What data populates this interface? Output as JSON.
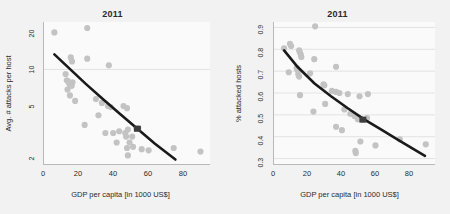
{
  "figure": {
    "background_color": "#f2f2f2",
    "panel_background_color": "#fafafa",
    "point_color": "#c3c3c3",
    "curve_color": "#1a1a1a",
    "marker_color": "#3d3d3d",
    "grid_color": "#d8d8d8",
    "axis_color": "#b9b9b9"
  },
  "chart_data": [
    {
      "type": "scatter",
      "panel": "left",
      "title": "2011",
      "xlabel": "GDP per capita [in 1000 US$]",
      "ylabel": "Avg. # attacks per host",
      "xlim": [
        -4,
        92
      ],
      "ylim": [
        1.75,
        24
      ],
      "yscale": "log",
      "xticks": [
        0,
        20,
        40,
        60,
        80
      ],
      "xticklabels": [
        "0",
        "20",
        "40",
        "60",
        "80"
      ],
      "yticks": [
        2,
        5,
        10,
        20
      ],
      "yticklabels": [
        "2",
        "5",
        "10",
        "20"
      ],
      "grid": "horizontal-at-y-10",
      "gridlines_y": [
        10
      ],
      "legend": "none",
      "points": [
        [
          2.0,
          19.8
        ],
        [
          21.0,
          21.5
        ],
        [
          11.5,
          12.5
        ],
        [
          12.2,
          11.6
        ],
        [
          21.0,
          12.2
        ],
        [
          33.5,
          10.8
        ],
        [
          8.5,
          9.2
        ],
        [
          9.2,
          8.2
        ],
        [
          10.0,
          8.0
        ],
        [
          10.8,
          7.6
        ],
        [
          12.0,
          7.4
        ],
        [
          12.5,
          7.9
        ],
        [
          9.6,
          6.9
        ],
        [
          11.0,
          6.2
        ],
        [
          14.0,
          5.6
        ],
        [
          26.0,
          5.8
        ],
        [
          29.5,
          5.4
        ],
        [
          33.0,
          5.1
        ],
        [
          34.5,
          5.0
        ],
        [
          42.0,
          5.1
        ],
        [
          44.0,
          4.9
        ],
        [
          19.5,
          3.6
        ],
        [
          27.5,
          4.3
        ],
        [
          31.5,
          3.1
        ],
        [
          36.0,
          3.1
        ],
        [
          39.5,
          3.2
        ],
        [
          43.0,
          3.1
        ],
        [
          43.5,
          2.9
        ],
        [
          44.5,
          3.3
        ],
        [
          45.5,
          2.6
        ],
        [
          47.0,
          2.9
        ],
        [
          49.5,
          3.4
        ],
        [
          50.5,
          3.4
        ],
        [
          38.0,
          2.6
        ],
        [
          44.0,
          2.35
        ],
        [
          44.5,
          2.05
        ],
        [
          47.5,
          2.4
        ],
        [
          52.5,
          2.3
        ],
        [
          56.5,
          2.25
        ],
        [
          71.0,
          2.35
        ],
        [
          86.5,
          2.2
        ]
      ],
      "fit_curve": {
        "description": "log-linear regression line",
        "x": [
          2,
          10,
          20,
          30,
          40,
          50,
          60,
          72
        ],
        "y": [
          13.2,
          10.4,
          7.7,
          5.8,
          4.4,
          3.35,
          2.55,
          1.9
        ]
      },
      "highlight_marker": {
        "x": 50,
        "y": 3.35,
        "shape": "square"
      }
    },
    {
      "type": "scatter",
      "panel": "right",
      "title": "2011",
      "xlabel": "GDP per capita [in 1000 US$]",
      "ylabel": "% attacked hosts",
      "xlim": [
        -4,
        92
      ],
      "ylim": [
        0.275,
        0.925
      ],
      "yscale": "linear",
      "xticks": [
        0,
        20,
        40,
        60,
        80
      ],
      "xticklabels": [
        "0",
        "20",
        "40",
        "60",
        "80"
      ],
      "yticks": [
        0.3,
        0.4,
        0.5,
        0.6,
        0.7,
        0.8,
        0.9
      ],
      "yticklabels": [
        "0.3",
        "0.4",
        "0.5",
        "0.6",
        "0.7",
        "0.8",
        "0.9"
      ],
      "grid": "horizontal",
      "gridlines_y": [
        0.3,
        0.4,
        0.5,
        0.6,
        0.7,
        0.8,
        0.9
      ],
      "legend": "none",
      "points": [
        [
          20.5,
          0.905
        ],
        [
          2.0,
          0.805
        ],
        [
          5.5,
          0.825
        ],
        [
          6.2,
          0.815
        ],
        [
          11.0,
          0.795
        ],
        [
          11.5,
          0.785
        ],
        [
          12.0,
          0.775
        ],
        [
          12.3,
          0.765
        ],
        [
          20.0,
          0.755
        ],
        [
          4.8,
          0.695
        ],
        [
          9.5,
          0.715
        ],
        [
          10.0,
          0.705
        ],
        [
          10.5,
          0.685
        ],
        [
          11.0,
          0.675
        ],
        [
          17.5,
          0.69
        ],
        [
          33.0,
          0.72
        ],
        [
          11.5,
          0.59
        ],
        [
          25.5,
          0.64
        ],
        [
          26.0,
          0.635
        ],
        [
          30.5,
          0.61
        ],
        [
          33.0,
          0.605
        ],
        [
          35.0,
          0.6
        ],
        [
          40.0,
          0.595
        ],
        [
          47.0,
          0.585
        ],
        [
          52.0,
          0.595
        ],
        [
          26.5,
          0.55
        ],
        [
          19.5,
          0.515
        ],
        [
          38.0,
          0.525
        ],
        [
          41.5,
          0.505
        ],
        [
          44.0,
          0.495
        ],
        [
          46.0,
          0.48
        ],
        [
          49.0,
          0.478
        ],
        [
          51.5,
          0.485
        ],
        [
          33.0,
          0.445
        ],
        [
          36.5,
          0.43
        ],
        [
          44.5,
          0.335
        ],
        [
          44.8,
          0.325
        ],
        [
          47.5,
          0.378
        ],
        [
          56.5,
          0.36
        ],
        [
          71.0,
          0.388
        ],
        [
          86.5,
          0.365
        ]
      ],
      "fit_curve": {
        "description": "decaying regression curve",
        "x": [
          2,
          10,
          20,
          30,
          40,
          50,
          60,
          70,
          86
        ],
        "y": [
          0.795,
          0.72,
          0.645,
          0.585,
          0.53,
          0.478,
          0.432,
          0.385,
          0.312
        ]
      },
      "highlight_marker": {
        "x": 49,
        "y": 0.478,
        "shape": "square"
      }
    }
  ]
}
